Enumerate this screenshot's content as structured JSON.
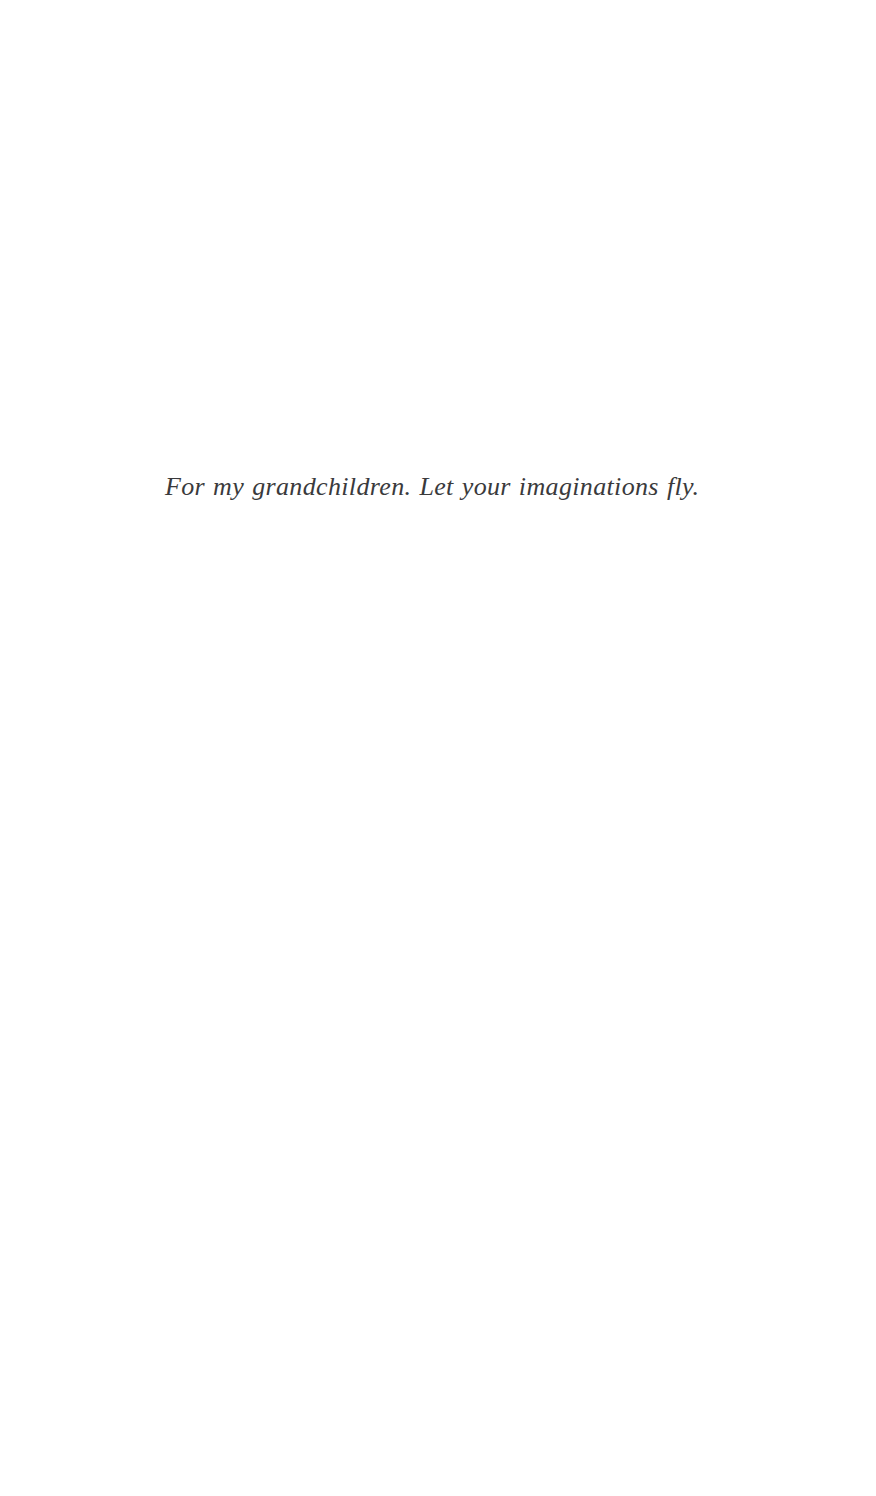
{
  "page": {
    "width": 876,
    "height": 1496,
    "background_color": "#ffffff",
    "kind": "book-dedication-page"
  },
  "dedication": {
    "text": "For my grandchildren. Let your imaginations fly.",
    "color": "#3a3a3c",
    "style": "italic-serif"
  }
}
